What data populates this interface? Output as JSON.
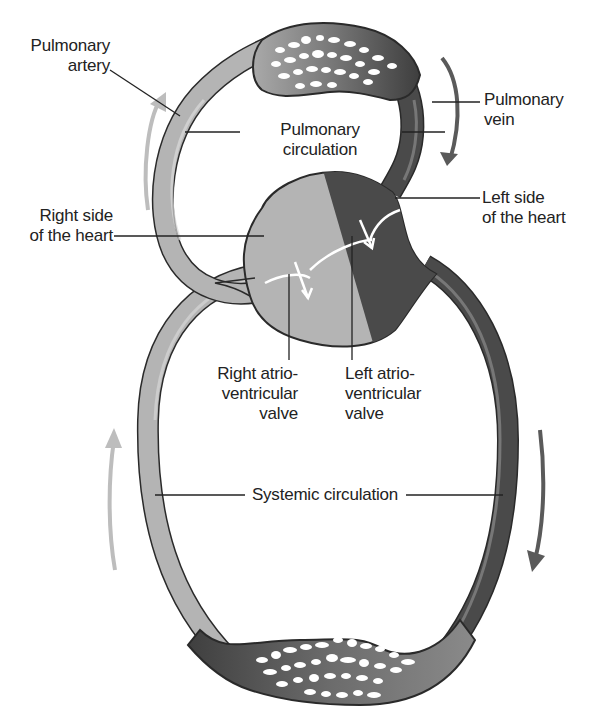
{
  "diagram": {
    "type": "circulation-diagram",
    "colors": {
      "deoxygenated_light": "#b4b4b4",
      "oxygenated_dark": "#4a4a4a",
      "outline": "#2a2a2a",
      "flow_arrow_light": "#bdbdbd",
      "flow_arrow_dark": "#5a5a5a",
      "valve_arrow": "#ffffff"
    },
    "labels": {
      "pulmonary_artery": "Pulmonary\nartery",
      "pulmonary_vein": "Pulmonary\nvein",
      "pulmonary_circulation": "Pulmonary\ncirculation",
      "right_side_heart": "Right side\nof the heart",
      "left_side_heart": "Left side\nof the heart",
      "right_av_valve": "Right atrio-\nventricular\nvalve",
      "left_av_valve": "Left atrio-\nventricular\nvalve",
      "systemic_circulation": "Systemic circulation"
    },
    "structures": [
      "lung capillary bed",
      "heart",
      "body capillary bed",
      "pulmonary loop",
      "systemic loop"
    ]
  }
}
